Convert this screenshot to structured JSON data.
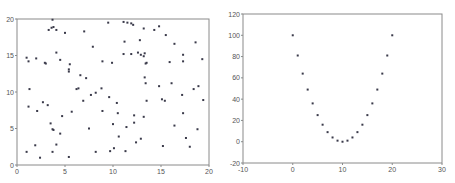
{
  "chart_data": [
    {
      "type": "scatter",
      "title": "",
      "xlabel": "",
      "ylabel": "",
      "xlim": [
        0,
        20
      ],
      "ylim": [
        0,
        20
      ],
      "xticks": [
        0,
        5,
        10,
        15,
        20
      ],
      "yticks": [
        0,
        5,
        10,
        15,
        20
      ],
      "grid": false,
      "marker_color": "#3a3a4a",
      "points": [
        [
          3.7,
          19.9
        ],
        [
          9.5,
          19.5
        ],
        [
          11.1,
          19.6
        ],
        [
          11.5,
          19.5
        ],
        [
          11.9,
          19.4
        ],
        [
          12.1,
          19.2
        ],
        [
          14.8,
          19.0
        ],
        [
          3.8,
          18.9
        ],
        [
          3.6,
          18.8
        ],
        [
          4.1,
          18.5
        ],
        [
          3.3,
          18.5
        ],
        [
          5.0,
          18.1
        ],
        [
          7.0,
          18.3
        ],
        [
          13.2,
          18.7
        ],
        [
          14.3,
          18.5
        ],
        [
          15.5,
          17.8
        ],
        [
          11.2,
          16.9
        ],
        [
          12.8,
          17.1
        ],
        [
          16.4,
          16.6
        ],
        [
          18.6,
          16.8
        ],
        [
          7.9,
          16.2
        ],
        [
          1.0,
          14.7
        ],
        [
          1.2,
          14.2
        ],
        [
          2.0,
          14.6
        ],
        [
          2.9,
          14.0
        ],
        [
          3.0,
          13.9
        ],
        [
          4.1,
          15.4
        ],
        [
          4.5,
          14.4
        ],
        [
          5.5,
          13.8
        ],
        [
          5.4,
          13.1
        ],
        [
          5.4,
          12.8
        ],
        [
          8.9,
          14.2
        ],
        [
          9.9,
          14.0
        ],
        [
          11.1,
          15.2
        ],
        [
          11.9,
          15.2
        ],
        [
          12.6,
          15.4
        ],
        [
          12.9,
          15.1
        ],
        [
          13.3,
          15.3
        ],
        [
          13.2,
          14.9
        ],
        [
          13.5,
          14.0
        ],
        [
          13.4,
          13.9
        ],
        [
          15.9,
          14.1
        ],
        [
          17.3,
          15.1
        ],
        [
          17.3,
          14.2
        ],
        [
          19.3,
          14.5
        ],
        [
          6.6,
          12.3
        ],
        [
          7.2,
          11.9
        ],
        [
          6.4,
          10.5
        ],
        [
          6.2,
          10.4
        ],
        [
          7.7,
          9.6
        ],
        [
          8.2,
          9.9
        ],
        [
          8.8,
          10.5
        ],
        [
          13.3,
          12.0
        ],
        [
          13.4,
          11.2
        ],
        [
          14.8,
          10.8
        ],
        [
          16.1,
          11.2
        ],
        [
          1.3,
          10.4
        ],
        [
          1.2,
          8.0
        ],
        [
          2.7,
          8.6
        ],
        [
          3.2,
          8.2
        ],
        [
          2.1,
          7.4
        ],
        [
          4.7,
          6.7
        ],
        [
          5.7,
          7.3
        ],
        [
          6.9,
          8.8
        ],
        [
          9.6,
          9.3
        ],
        [
          10.4,
          8.5
        ],
        [
          8.9,
          7.4
        ],
        [
          13.5,
          8.8
        ],
        [
          15.1,
          9.0
        ],
        [
          15.4,
          8.8
        ],
        [
          17.2,
          9.6
        ],
        [
          18.4,
          10.4
        ],
        [
          18.9,
          10.8
        ],
        [
          19.4,
          8.9
        ],
        [
          3.5,
          5.7
        ],
        [
          3.7,
          4.9
        ],
        [
          3.8,
          4.8
        ],
        [
          4.5,
          4.3
        ],
        [
          7.5,
          5.0
        ],
        [
          10.0,
          5.6
        ],
        [
          10.5,
          7.1
        ],
        [
          11.4,
          5.2
        ],
        [
          12.2,
          5.8
        ],
        [
          12.2,
          6.8
        ],
        [
          13.2,
          6.6
        ],
        [
          16.4,
          5.4
        ],
        [
          17.3,
          7.1
        ],
        [
          1.0,
          1.8
        ],
        [
          1.9,
          2.7
        ],
        [
          2.4,
          1.0
        ],
        [
          3.7,
          1.8
        ],
        [
          4.1,
          2.8
        ],
        [
          5.4,
          1.1
        ],
        [
          8.2,
          1.8
        ],
        [
          9.7,
          1.9
        ],
        [
          10.1,
          2.3
        ],
        [
          10.6,
          3.9
        ],
        [
          11.3,
          1.9
        ],
        [
          12.4,
          3.1
        ],
        [
          12.9,
          3.6
        ],
        [
          15.2,
          2.6
        ],
        [
          17.6,
          3.7
        ],
        [
          18.0,
          2.5
        ],
        [
          18.8,
          4.9
        ]
      ]
    },
    {
      "type": "scatter",
      "title": "",
      "xlabel": "",
      "ylabel": "",
      "xlim": [
        -10,
        30
      ],
      "ylim": [
        -20,
        120
      ],
      "xticks": [
        -10,
        0,
        10,
        20,
        30
      ],
      "yticks": [
        -20,
        0,
        20,
        40,
        60,
        80,
        100,
        120
      ],
      "grid": false,
      "marker_color": "#3a3a4a",
      "x": [
        0,
        1,
        2,
        3,
        4,
        5,
        6,
        7,
        8,
        9,
        10,
        11,
        12,
        13,
        14,
        15,
        16,
        17,
        18,
        19,
        20
      ],
      "y": [
        100,
        81,
        64,
        49,
        36,
        25,
        16,
        9,
        4,
        1,
        0,
        1,
        4,
        9,
        16,
        25,
        36,
        49,
        64,
        81,
        100
      ]
    }
  ]
}
